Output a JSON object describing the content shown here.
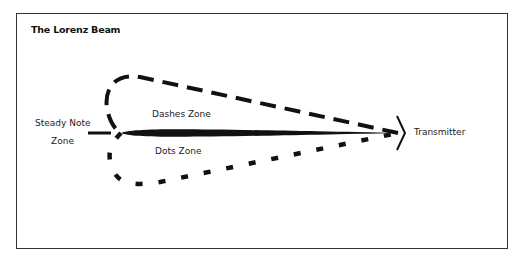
{
  "title": "The Lorenz Beam",
  "labels": {
    "steady_note_line1": "Steady Note",
    "steady_note_line2": "Zone",
    "dashes_zone": "Dashes Zone",
    "dots_zone": "Dots Zone",
    "transmitter": "Transmitter"
  },
  "colors": {
    "ink": "#111111",
    "frame": "#333333",
    "background": "#ffffff"
  }
}
